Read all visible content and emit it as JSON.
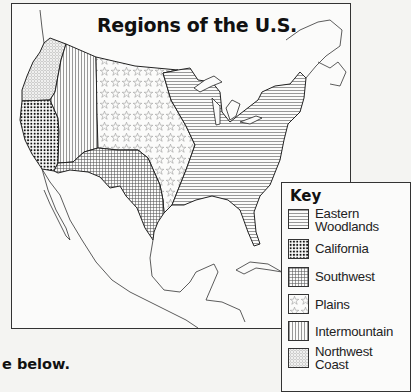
{
  "map": {
    "title": "Regions of the U.S.",
    "regions": [
      {
        "id": "northwest-coast",
        "name": "Northwest Coast",
        "pattern": "small-circles"
      },
      {
        "id": "california",
        "name": "California",
        "pattern": "dots"
      },
      {
        "id": "intermountain",
        "name": "Intermountain",
        "pattern": "vertical-lines"
      },
      {
        "id": "plains",
        "name": "Plains",
        "pattern": "stars"
      },
      {
        "id": "southwest",
        "name": "Southwest",
        "pattern": "grid"
      },
      {
        "id": "eastern-woodlands",
        "name": "Eastern Woodlands",
        "pattern": "horizontal-lines"
      }
    ]
  },
  "legend": {
    "title": "Key",
    "items": [
      {
        "label_line1": "Eastern",
        "label_line2": "Woodlands",
        "pattern": "horizontal-lines"
      },
      {
        "label_line1": "California",
        "label_line2": "",
        "pattern": "dots"
      },
      {
        "label_line1": "Southwest",
        "label_line2": "",
        "pattern": "grid"
      },
      {
        "label_line1": "Plains",
        "label_line2": "",
        "pattern": "stars"
      },
      {
        "label_line1": "Intermountain",
        "label_line2": "",
        "pattern": "vertical-lines"
      },
      {
        "label_line1": "Northwest",
        "label_line2": "Coast",
        "pattern": "small-circles"
      }
    ]
  },
  "footer": {
    "text": "e below."
  }
}
